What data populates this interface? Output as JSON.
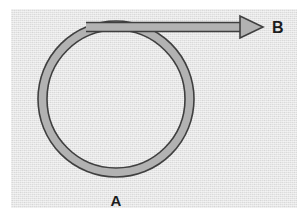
{
  "figure": {
    "canvas": {
      "width": 306,
      "height": 216,
      "background": "#ffffff"
    },
    "panel": {
      "name": "diagram-panel",
      "x": 11,
      "y": 9,
      "width": 286,
      "height": 199,
      "fill": "#ececec",
      "texture": "scanned-paper-noise"
    },
    "style": {
      "band_fill": "#b2b2b2",
      "band_outline": "#3f3f3f",
      "band_outline_width": 1.6,
      "label_color": "#1c1c1c"
    },
    "loop": {
      "name": "circular-loop",
      "shape": "annulus",
      "center_x": 116,
      "center_y": 99,
      "outer_radius": 78,
      "inner_radius": 69,
      "band_thickness": 9
    },
    "lead": {
      "name": "straight-lead",
      "shape": "horizontal-band",
      "start_x": 86,
      "end_x": 245,
      "center_y": 27,
      "thickness": 9
    },
    "arrowhead": {
      "name": "arrow-tip",
      "tip_x": 263,
      "tip_y": 27,
      "back_x": 240,
      "half_height": 11,
      "direction": "right"
    },
    "labels": [
      {
        "id": "label-a",
        "text": "A",
        "x": 116,
        "y": 206,
        "anchor": "middle",
        "font_size": 15
      },
      {
        "id": "label-b",
        "text": "B",
        "x": 272,
        "y": 33,
        "anchor": "start",
        "font_size": 16
      }
    ]
  }
}
